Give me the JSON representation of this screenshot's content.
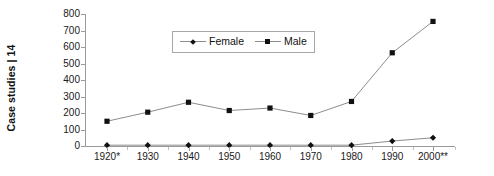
{
  "chart_data": {
    "type": "line",
    "title": "",
    "xlabel": "",
    "ylabel": "Case studies | 14",
    "categories": [
      "1920*",
      "1930",
      "1940",
      "1950",
      "1960",
      "1970",
      "1980",
      "1990",
      "2000**"
    ],
    "series": [
      {
        "name": "Female",
        "marker": "diamond",
        "values": [
          5,
          5,
          5,
          5,
          5,
          5,
          5,
          30,
          50
        ]
      },
      {
        "name": "Male",
        "marker": "square",
        "values": [
          150,
          205,
          265,
          215,
          230,
          185,
          270,
          565,
          755
        ]
      }
    ],
    "ylim": [
      0,
      800
    ],
    "yticks": [
      0,
      100,
      200,
      300,
      400,
      500,
      600,
      700,
      800
    ],
    "ytick_labels": [
      "0",
      "100",
      "200",
      "300",
      "400",
      "500",
      "600",
      "700",
      "800"
    ],
    "grid": false,
    "legend_position": "inside-top-center",
    "line_color": "#8c8c8c",
    "marker_color": "#111111",
    "axis_color": "#9a9a9a"
  }
}
